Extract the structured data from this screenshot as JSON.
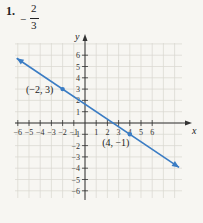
{
  "problem": {
    "number": "1.",
    "answer_sign": "−",
    "answer_numerator": "2",
    "answer_denominator": "3"
  },
  "chart_data": {
    "type": "line",
    "title": "",
    "xlabel": "x",
    "ylabel": "y",
    "xlim": [
      -6,
      6
    ],
    "ylim": [
      -6,
      6
    ],
    "grid": true,
    "x_ticks": [
      -6,
      -5,
      -4,
      -3,
      -2,
      -1,
      1,
      2,
      3,
      4,
      5,
      6
    ],
    "y_ticks": [
      6,
      5,
      4,
      3,
      2,
      1,
      -1,
      -2,
      -3,
      -4,
      -5,
      -6
    ],
    "line": {
      "slope": "-2/3",
      "y_intercept": 1.667,
      "color": "#3a7cc4",
      "arrows_both_ends": true
    },
    "points": [
      {
        "x": -2,
        "y": 3,
        "label": "(−2, 3)"
      },
      {
        "x": 4,
        "y": -1,
        "label": "(4, −1)"
      }
    ]
  },
  "colors": {
    "background": "#f7f6f2",
    "grid": "#d9d7d0",
    "axis": "#333333",
    "line": "#3a7cc4"
  }
}
